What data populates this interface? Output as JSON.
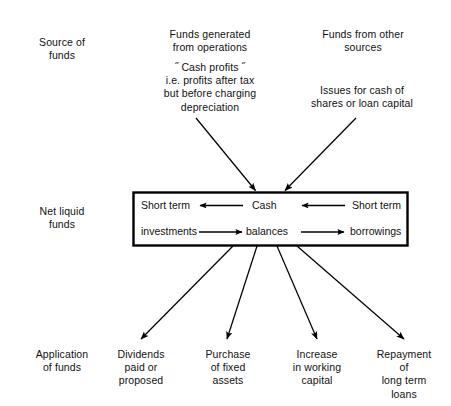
{
  "diagram": {
    "row_labels": [
      {
        "id": "source-of-funds",
        "text": "Source of\nfunds"
      },
      {
        "id": "net-liquid-funds",
        "text": "Net liquid\nfunds"
      },
      {
        "id": "application-of-funds",
        "text": "Application\nof funds"
      }
    ],
    "sources": [
      {
        "id": "funds-generated",
        "text": "Funds generated\nfrom operations"
      },
      {
        "id": "cash-profits-note",
        "text": "˝ Cash profits ˝\ni.e. profits after tax\nbut before charging\ndepreciation"
      },
      {
        "id": "funds-other-sources",
        "text": "Funds from other\nsources"
      },
      {
        "id": "issues-for-cash",
        "text": "Issues for cash of\nshares or loan capital"
      }
    ],
    "center_box": {
      "left_top": "Short term",
      "left_bottom": "investments",
      "middle_top": "Cash",
      "middle_bottom": "balances",
      "right_top": "Short term",
      "right_bottom": "borrowings",
      "border_color": "#000000"
    },
    "applications": [
      {
        "id": "dividends",
        "text": "Dividends\npaid or\nproposed"
      },
      {
        "id": "purchase-fixed-assets",
        "text": "Purchase\nof fixed\nassets"
      },
      {
        "id": "increase-working-capital",
        "text": "Increase\nin working\ncapital"
      },
      {
        "id": "repayment-long-term-loans",
        "text": "Repayment\nof\nlong term\nloans"
      }
    ],
    "arrow_color": "#000000"
  }
}
